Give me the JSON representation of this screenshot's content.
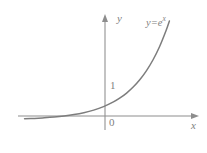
{
  "figure": {
    "background_color": "#ffffff",
    "axis_color": "#8d8d8d",
    "curve_color": "#7d7d7d",
    "text_color": "#7f7f7f",
    "labels": {
      "y_axis": "y",
      "x_axis": "x",
      "origin": "0",
      "y_intercept_tick": "1",
      "equation_base": "y=e",
      "equation_exponent": "x"
    }
  },
  "chart_data": {
    "type": "line",
    "title": "",
    "subtitle": "",
    "xlabel": "x",
    "ylabel": "y",
    "grid": false,
    "legend": null,
    "annotations": [
      {
        "text": "y=e^x",
        "x": 1.45,
        "y": 4.3,
        "note": "curve label at upper right of curve"
      },
      {
        "text": "1",
        "x": 0.18,
        "y": 1.0,
        "note": "y-intercept tick label"
      },
      {
        "text": "0",
        "x": 0.18,
        "y": -0.25,
        "note": "origin label"
      }
    ],
    "axis_ranges": {
      "xlim": [
        -3.1,
        2.4
      ],
      "ylim": [
        -0.45,
        4.8
      ]
    },
    "axis_arrows": {
      "x": "right",
      "y": "up"
    },
    "series": [
      {
        "name": "y=e^x",
        "x": [
          -2.9,
          -2.6,
          -2.3,
          -2.0,
          -1.7,
          -1.4,
          -1.1,
          -0.8,
          -0.5,
          -0.2,
          0.0,
          0.2,
          0.4,
          0.6,
          0.8,
          1.0,
          1.2,
          1.4,
          1.5
        ],
        "values": [
          0.055,
          0.074,
          0.1,
          0.135,
          0.183,
          0.247,
          0.333,
          0.449,
          0.607,
          0.819,
          1.0,
          1.221,
          1.492,
          1.822,
          2.226,
          2.718,
          3.32,
          4.055,
          4.482
        ]
      }
    ]
  }
}
